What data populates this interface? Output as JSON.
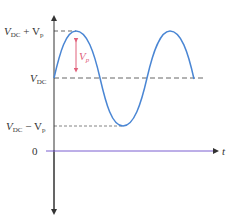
{
  "diagram": {
    "labels": {
      "top_main": "V",
      "top_sub1": "DC",
      "top_plus": " + V",
      "top_sub2": "p",
      "mid_main": "V",
      "mid_sub": "DC",
      "low_main": "V",
      "low_sub1": "DC",
      "low_minus": " − V",
      "low_sub2": "p",
      "zero": "0",
      "t_axis": "t",
      "amp_main": "V",
      "amp_sub": "p"
    },
    "colors": {
      "wave": "#4a86d4",
      "axis": "#333333",
      "time_axis": "#7a5fd0",
      "dashed": "#666666",
      "amplitude_arrow": "#e0607a"
    }
  }
}
